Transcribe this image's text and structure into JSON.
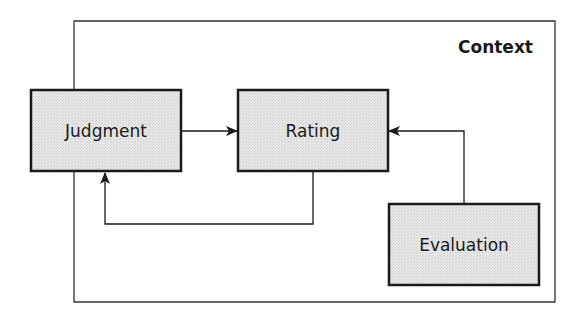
{
  "diagram": {
    "context": {
      "label": "Context"
    },
    "nodes": [
      {
        "id": "judgment",
        "label": "Judgment"
      },
      {
        "id": "rating",
        "label": "Rating"
      },
      {
        "id": "evaluation",
        "label": "Evaluation"
      }
    ],
    "edges": [
      {
        "from": "judgment",
        "to": "rating"
      },
      {
        "from": "rating",
        "to": "judgment"
      },
      {
        "from": "evaluation",
        "to": "rating"
      }
    ],
    "colors": {
      "box_fill": "#e3e3e3",
      "stroke": "#1a1a1a",
      "frame": "#333333"
    }
  }
}
